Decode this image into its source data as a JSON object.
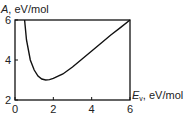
{
  "chart_data": {
    "type": "line",
    "title": "",
    "xlabel": "E_v, eV/mol",
    "ylabel": "A, eV/mol",
    "xlim": [
      0,
      6
    ],
    "ylim": [
      2,
      6
    ],
    "x_ticks": [
      "0",
      "2",
      "4",
      "6"
    ],
    "y_ticks": [
      "2",
      "4",
      "6"
    ],
    "grid": false,
    "series": [
      {
        "name": "A(E_v)",
        "x": [
          0.5,
          0.6,
          0.8,
          1.0,
          1.2,
          1.4,
          1.6,
          1.8,
          2.0,
          2.5,
          3.0,
          3.5,
          4.0,
          4.5,
          5.0,
          5.5,
          6.0
        ],
        "y": [
          6.0,
          5.0,
          4.0,
          3.5,
          3.2,
          3.05,
          3.0,
          3.02,
          3.08,
          3.3,
          3.65,
          4.05,
          4.45,
          4.85,
          5.25,
          5.62,
          6.0
        ]
      }
    ]
  },
  "labels": {
    "y_axis_main": "A",
    "y_axis_unit": ", eV/mol",
    "x_axis_main": "E",
    "x_axis_sub": "v",
    "x_axis_unit": ", eV/mol"
  }
}
